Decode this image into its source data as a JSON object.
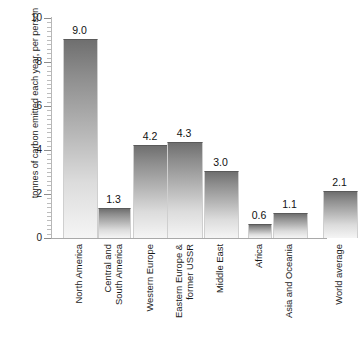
{
  "chart_data": {
    "type": "bar",
    "title": "",
    "xlabel": "",
    "ylabel": "tonnes of carbon emitted each year, per person",
    "ylim": [
      0,
      10
    ],
    "y_major_step": 2,
    "y_minor_step": 0.2,
    "grid": false,
    "legend": "none",
    "categories": [
      "North America",
      "Central and South America",
      "Western Europe",
      "Eastern Europe & former USSR",
      "Middle East",
      "Africa",
      "Asia and Oceania",
      "World average"
    ],
    "category_lines": [
      [
        "North America"
      ],
      [
        "Central and",
        "South America"
      ],
      [
        "Western Europe"
      ],
      [
        "Eastern Europe &",
        "former USSR"
      ],
      [
        "Middle East"
      ],
      [
        "Africa"
      ],
      [
        "Asia and Oceania"
      ],
      [
        "World average"
      ]
    ],
    "values": [
      9.0,
      1.3,
      4.2,
      4.3,
      3.0,
      0.6,
      1.1,
      2.1
    ],
    "value_labels": [
      "9.0",
      "1.3",
      "4.2",
      "4.3",
      "3.0",
      "0.6",
      "1.1",
      "2.1"
    ],
    "y_tick_labels": [
      "0",
      "2",
      "4",
      "6",
      "8",
      "10"
    ],
    "y_tick_values": [
      0,
      2,
      4,
      6,
      8,
      10
    ],
    "bar_color_top": "#6f6f6f",
    "bar_color_bottom": "#f5f5f5",
    "axis_color": "#a9a9a9",
    "text_color": "#1a1a1a"
  }
}
